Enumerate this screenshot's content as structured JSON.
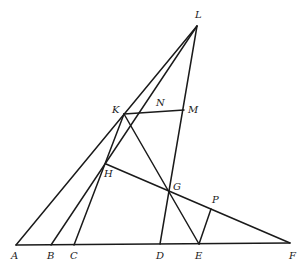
{
  "diagram": {
    "type": "geometry-figure",
    "stroke_color": "#1a1a1a",
    "background": "#ffffff",
    "points": {
      "L": {
        "x": 197,
        "y": 26,
        "label": "L",
        "lx": 195,
        "ly": 18
      },
      "K": {
        "x": 124,
        "y": 114,
        "label": "K",
        "lx": 112,
        "ly": 113
      },
      "N": {
        "x": 160,
        "y": 112,
        "label": "N",
        "lx": 156,
        "ly": 106
      },
      "M": {
        "x": 184,
        "y": 110,
        "label": "M",
        "lx": 188,
        "ly": 113
      },
      "H": {
        "x": 106,
        "y": 164,
        "label": "H",
        "lx": 104,
        "ly": 177
      },
      "G": {
        "x": 169,
        "y": 192,
        "label": "G",
        "lx": 173,
        "ly": 190
      },
      "P": {
        "x": 211,
        "y": 209,
        "label": "P",
        "lx": 212,
        "ly": 203
      },
      "A": {
        "x": 16,
        "y": 245,
        "label": "A",
        "lx": 11,
        "ly": 259
      },
      "B": {
        "x": 51,
        "y": 245,
        "label": "B",
        "lx": 47,
        "ly": 259
      },
      "C": {
        "x": 74,
        "y": 245,
        "label": "C",
        "lx": 70,
        "ly": 259
      },
      "D": {
        "x": 160,
        "y": 244,
        "label": "D",
        "lx": 156,
        "ly": 259
      },
      "E": {
        "x": 199,
        "y": 244,
        "label": "E",
        "lx": 195,
        "ly": 259
      },
      "F": {
        "x": 290,
        "y": 243,
        "label": "F",
        "lx": 289,
        "ly": 259
      }
    },
    "segments": [
      {
        "name": "segment-a-f",
        "from": "A",
        "to": "F"
      },
      {
        "name": "segment-a-l",
        "from": "A",
        "to": "L"
      },
      {
        "name": "segment-b-l",
        "from": "B",
        "to": "L"
      },
      {
        "name": "segment-c-k",
        "from": "C",
        "to": "K"
      },
      {
        "name": "segment-k-m",
        "from": "K",
        "to": "M"
      },
      {
        "name": "segment-l-d",
        "from": "L",
        "to": "D"
      },
      {
        "name": "segment-k-e",
        "from": "K",
        "to": "E"
      },
      {
        "name": "segment-h-f",
        "from": "H",
        "to": "F"
      },
      {
        "name": "segment-p-e",
        "from": "P",
        "to": "E"
      }
    ]
  }
}
